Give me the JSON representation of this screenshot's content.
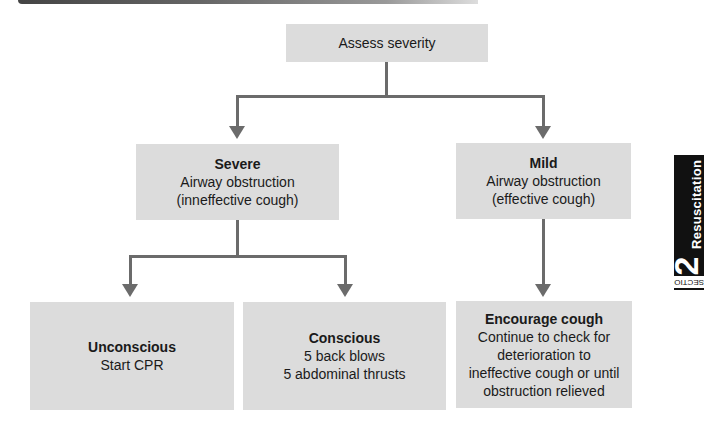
{
  "diagram": {
    "type": "flowchart",
    "nodes": {
      "assess": {
        "label": "Assess severity"
      },
      "severe": {
        "title": "Severe",
        "lines": [
          "Airway obstruction",
          "(inneffective cough)"
        ]
      },
      "mild": {
        "title": "Mild",
        "lines": [
          "Airway obstruction",
          "(effective cough)"
        ]
      },
      "unconscious": {
        "title": "Unconscious",
        "lines": [
          "Start CPR"
        ]
      },
      "conscious": {
        "title": "Conscious",
        "lines": [
          "5 back blows",
          "5 abdominal thrusts"
        ]
      },
      "encourage": {
        "title": "Encourage cough",
        "lines": [
          "Continue to check for",
          "deterioration to",
          "ineffective cough or until",
          "obstruction relieved"
        ]
      }
    },
    "edges": [
      {
        "from": "assess",
        "to": "severe"
      },
      {
        "from": "assess",
        "to": "mild"
      },
      {
        "from": "severe",
        "to": "unconscious"
      },
      {
        "from": "severe",
        "to": "conscious"
      },
      {
        "from": "mild",
        "to": "encourage"
      }
    ],
    "colors": {
      "box_fill": "#dcdcdc",
      "connector": "#6b6b6b",
      "tab_bg": "#111111"
    }
  },
  "side_tab": {
    "number": "2",
    "word": "Resuscitation",
    "section": "SECTION"
  }
}
